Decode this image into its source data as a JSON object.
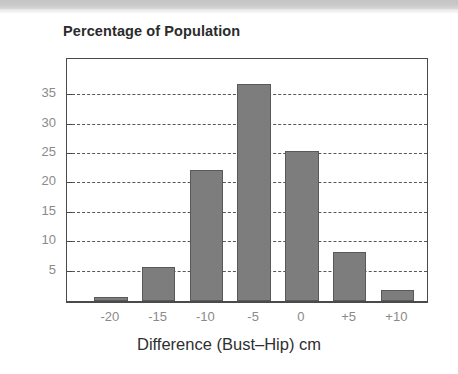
{
  "page": {
    "background_color": "#ffffff",
    "scan_band_color": "#c7c7c7"
  },
  "chart_data": {
    "type": "bar",
    "title": "Percentage of Population",
    "xlabel": "Difference (Bust–Hip) cm",
    "ylabel": "",
    "categories": [
      "-20",
      "-15",
      "-10",
      "-5",
      "0",
      "+5",
      "+10"
    ],
    "values": [
      0.7,
      5.8,
      22.3,
      37.0,
      25.6,
      8.3,
      1.8
    ],
    "ylim": [
      0,
      41
    ],
    "yticks": [
      5,
      10,
      15,
      20,
      25,
      30,
      35
    ],
    "ytick_labels": [
      "5",
      "10",
      "15",
      "20",
      "25",
      "30",
      "35"
    ],
    "grid": "horizontal-dashdot",
    "legend": "none",
    "bar_fill_color": "#7d7d7d",
    "bar_border_color": "#595959",
    "axis_color": "#4a4a4a",
    "gridline_color": "#3a3a3a",
    "tick_label_color": "#8a8a8a",
    "title_color": "#2b2b2b"
  }
}
